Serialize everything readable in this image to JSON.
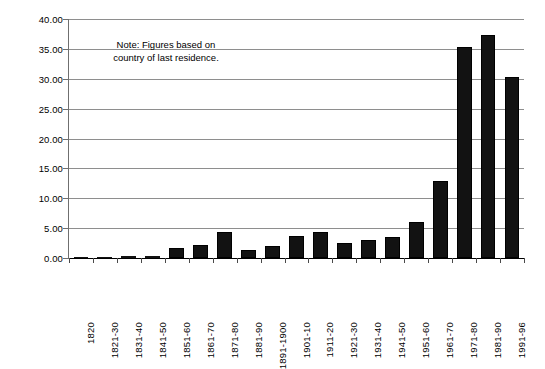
{
  "note": {
    "line1": "Note: Figures based on",
    "line2": "country of last residence."
  },
  "axis": {
    "y_ticks": [
      "40.00",
      "35.00",
      "30.00",
      "25.00",
      "20.00",
      "15.00",
      "10.00",
      "5.00",
      "0.00"
    ]
  },
  "chart_data": {
    "type": "bar",
    "title": "",
    "subtitle": "",
    "xlabel": "",
    "ylabel": "",
    "ylim": [
      0,
      40
    ],
    "ytick_step": 5,
    "grid": true,
    "legend": false,
    "bar_color": "#121212",
    "annotations": [
      "Note: Figures based on country of last residence."
    ],
    "categories": [
      "1820",
      "1821-30",
      "1831-40",
      "1841-50",
      "1851-60",
      "1861-70",
      "1871-80",
      "1881-90",
      "1891-1900",
      "1901-10",
      "1911-20",
      "1921-30",
      "1931-40",
      "1941-50",
      "1951-60",
      "1961-70",
      "1971-80",
      "1981-90",
      "1991-96"
    ],
    "values": [
      0.1,
      0.15,
      0.6,
      1.7,
      2.6,
      2.3,
      2.8,
      5.2,
      3.7,
      8.8,
      5.7,
      4.1,
      0.5,
      1.0,
      2.5,
      3.3,
      4.5,
      7.3,
      5.0
    ],
    "values_plotted": [
      0.1,
      0.15,
      0.3,
      0.4,
      1.6,
      2.2,
      4.4,
      1.3,
      2.0,
      3.7,
      4.3,
      2.5,
      3.0,
      3.5,
      6.0,
      12.9,
      35.3,
      37.4,
      30.3
    ],
    "ytick_labels": [
      "0.00",
      "5.00",
      "10.00",
      "15.00",
      "20.00",
      "25.00",
      "30.00",
      "35.00",
      "40.00"
    ]
  }
}
